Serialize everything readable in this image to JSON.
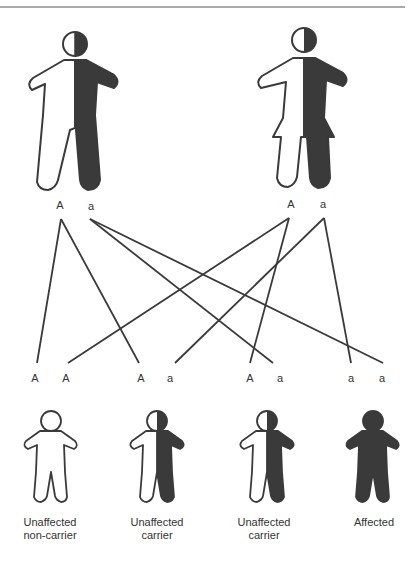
{
  "header": {
    "cropped_text": "...",
    "rule_color": "#555555"
  },
  "colors": {
    "ink": "#3a3a3a",
    "fill_affected": "#3a3a3a",
    "fill_unaffected": "#ffffff"
  },
  "parents": [
    {
      "sex": "male",
      "status": "carrier",
      "alleles": [
        "A",
        "a"
      ]
    },
    {
      "sex": "female",
      "status": "carrier",
      "alleles": [
        "A",
        "a"
      ]
    }
  ],
  "offspring": [
    {
      "genotype": [
        "A",
        "A"
      ],
      "label_line1": "Unaffected",
      "label_line2": "non-carrier",
      "status": "unaffected"
    },
    {
      "genotype": [
        "A",
        "a"
      ],
      "label_line1": "Unaffected",
      "label_line2": "carrier",
      "status": "carrier"
    },
    {
      "genotype": [
        "A",
        "a"
      ],
      "label_line1": "Unaffected",
      "label_line2": "carrier",
      "status": "carrier"
    },
    {
      "genotype": [
        "a",
        "a"
      ],
      "label_line1": "Affected",
      "label_line2": "",
      "status": "affected"
    }
  ]
}
